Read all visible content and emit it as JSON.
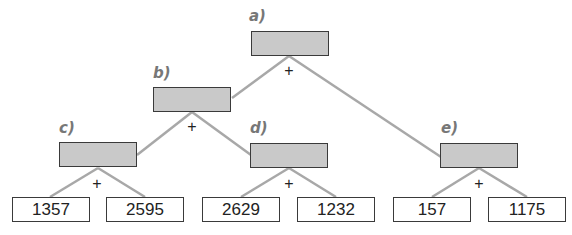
{
  "diagram": {
    "type": "addition-tree",
    "operator": "+",
    "line_color": "#a8a8a8",
    "node_fill": "#c9c9c9",
    "nodes": {
      "a": {
        "label": "a)",
        "value": ""
      },
      "b": {
        "label": "b)",
        "value": ""
      },
      "c": {
        "label": "c)",
        "value": ""
      },
      "d": {
        "label": "d)",
        "value": ""
      },
      "e": {
        "label": "e)",
        "value": ""
      }
    },
    "leaves": [
      "1357",
      "2595",
      "2629",
      "1232",
      "157",
      "1175"
    ],
    "edges": [
      [
        "a",
        "b"
      ],
      [
        "a",
        "e"
      ],
      [
        "b",
        "c"
      ],
      [
        "b",
        "d"
      ],
      [
        "c",
        "1357"
      ],
      [
        "c",
        "2595"
      ],
      [
        "d",
        "2629"
      ],
      [
        "d",
        "1232"
      ],
      [
        "e",
        "157"
      ],
      [
        "e",
        "1175"
      ]
    ]
  }
}
